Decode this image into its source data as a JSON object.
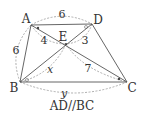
{
  "diagram": {
    "points": {
      "A": {
        "label": "A",
        "x": 31,
        "y": 25
      },
      "D": {
        "label": "D",
        "x": 92,
        "y": 24
      },
      "E": {
        "label": "E",
        "x": 66,
        "y": 44
      },
      "B": {
        "label": "B",
        "x": 20,
        "y": 82
      },
      "C": {
        "label": "C",
        "x": 127,
        "y": 82
      }
    },
    "measures": {
      "AD": "6",
      "AB": "6",
      "AE": "4",
      "DE": "3",
      "BE": "x",
      "CE": "7",
      "BC": "y"
    },
    "caption": "AD//BC",
    "colors": {
      "line": "#555555",
      "dashed": "#999999",
      "text": "#333333"
    }
  }
}
